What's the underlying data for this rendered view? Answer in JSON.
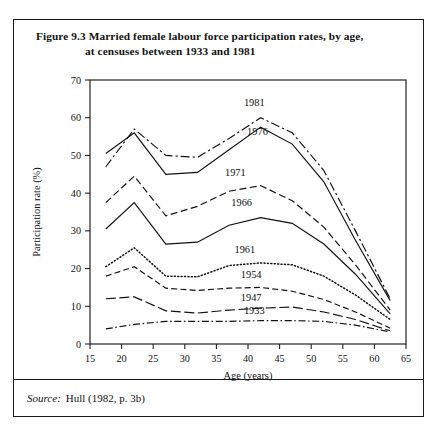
{
  "figure": {
    "title_line1": "Figure 9.3  Married female labour force participation rates, by age,",
    "title_line2": "at censuses between 1933 and 1981",
    "source_label": "Source:",
    "source_text": "Hull (1982, p. 3b)"
  },
  "chart_data": {
    "type": "line",
    "title": "Figure 9.3  Married female labour force participation rates, by age, at censuses between 1933 and 1981",
    "xlabel": "Age (years)",
    "ylabel": "Participation rate (%)",
    "xlim": [
      15,
      65
    ],
    "ylim": [
      0,
      70
    ],
    "xticks": [
      15,
      20,
      25,
      30,
      35,
      40,
      45,
      50,
      55,
      60,
      65
    ],
    "yticks": [
      0,
      10,
      20,
      30,
      40,
      50,
      60,
      70
    ],
    "grid": false,
    "legend": "inline-labels",
    "series": [
      {
        "name": "1981",
        "style": "dash-dot",
        "color": "#111111",
        "x": [
          17.5,
          22,
          27,
          32,
          37,
          42,
          47,
          52,
          57,
          62.5
        ],
        "y": [
          47.0,
          57.0,
          50.0,
          49.5,
          54.5,
          60.0,
          56.0,
          46.0,
          30.0,
          12.0
        ]
      },
      {
        "name": "1976",
        "style": "solid",
        "color": "#111111",
        "x": [
          17.5,
          22,
          27,
          32,
          37,
          42,
          47,
          52,
          57,
          62.5
        ],
        "y": [
          50.5,
          56.0,
          45.0,
          45.5,
          51.5,
          57.5,
          53.0,
          43.0,
          27.5,
          11.5
        ]
      },
      {
        "name": "1971",
        "style": "dashed",
        "color": "#111111",
        "x": [
          17.5,
          22,
          27,
          32,
          37,
          42,
          47,
          52,
          57,
          62.5
        ],
        "y": [
          37.5,
          44.5,
          34.0,
          36.5,
          40.5,
          42.0,
          38.0,
          31.0,
          21.0,
          9.0
        ]
      },
      {
        "name": "1966",
        "style": "solid",
        "color": "#111111",
        "x": [
          17.5,
          22,
          27,
          32,
          37,
          42,
          47,
          52,
          57,
          62.5
        ],
        "y": [
          30.5,
          37.5,
          26.5,
          27.0,
          31.5,
          33.5,
          32.0,
          26.5,
          18.5,
          8.0
        ]
      },
      {
        "name": "1961",
        "style": "dotted",
        "color": "#111111",
        "x": [
          17.5,
          22,
          27,
          32,
          37,
          42,
          47,
          52,
          57,
          62.5
        ],
        "y": [
          20.5,
          25.5,
          18.0,
          17.8,
          20.8,
          21.5,
          21.0,
          18.0,
          13.0,
          6.5
        ]
      },
      {
        "name": "1954",
        "style": "medium-dash",
        "color": "#111111",
        "x": [
          17.5,
          22,
          27,
          32,
          37,
          42,
          47,
          52,
          57,
          62.5
        ],
        "y": [
          18.0,
          20.5,
          14.8,
          14.2,
          14.8,
          15.0,
          14.0,
          11.8,
          8.5,
          4.2
        ]
      },
      {
        "name": "1947",
        "style": "long-dash",
        "color": "#111111",
        "x": [
          17.5,
          22,
          27,
          32,
          37,
          42,
          47,
          52,
          57,
          62.5
        ],
        "y": [
          12.0,
          12.5,
          8.8,
          8.2,
          9.0,
          9.5,
          9.8,
          8.5,
          6.5,
          3.5
        ]
      },
      {
        "name": "1933",
        "style": "dash-dot-short",
        "color": "#111111",
        "x": [
          17.5,
          22,
          27,
          32,
          37,
          42,
          47,
          52,
          57,
          62.5
        ],
        "y": [
          4.0,
          5.2,
          6.0,
          6.0,
          6.0,
          6.2,
          6.2,
          6.0,
          5.0,
          3.2
        ]
      }
    ],
    "annotations": [
      {
        "text": "1981",
        "x": 41.0,
        "y": 63.0
      },
      {
        "text": "1976",
        "x": 41.5,
        "y": 55.5
      },
      {
        "text": "1971",
        "x": 38.0,
        "y": 44.5
      },
      {
        "text": "1966",
        "x": 39.0,
        "y": 36.5
      },
      {
        "text": "1961",
        "x": 39.5,
        "y": 24.0
      },
      {
        "text": "1954",
        "x": 40.5,
        "y": 17.5
      },
      {
        "text": "1947",
        "x": 40.5,
        "y": 11.5
      },
      {
        "text": "1933",
        "x": 41.0,
        "y": 8.0
      }
    ]
  }
}
